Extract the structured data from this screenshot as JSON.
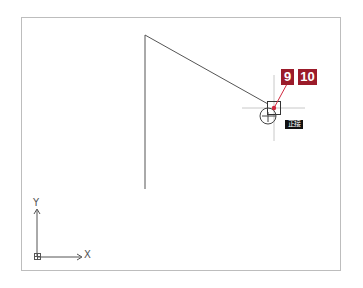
{
  "drawing": {
    "polyline": {
      "points": [
        [
          145,
          189
        ],
        [
          145,
          35
        ],
        [
          268,
          104
        ]
      ],
      "color": "#555555"
    },
    "cursor": {
      "x": 274,
      "y": 108,
      "crosshair_color": "#c8c8c8",
      "snap_box_size": 13,
      "snap_marker": "tangent-circle"
    },
    "snap_tooltip": {
      "label": "正接"
    },
    "ucs": {
      "x_label": "X",
      "y_label": "Y"
    }
  },
  "callouts": {
    "color": "#9b1b2a",
    "items": [
      {
        "label": "9"
      },
      {
        "label": "10"
      }
    ],
    "pointer_dot": {
      "x": 274,
      "y": 108
    }
  }
}
